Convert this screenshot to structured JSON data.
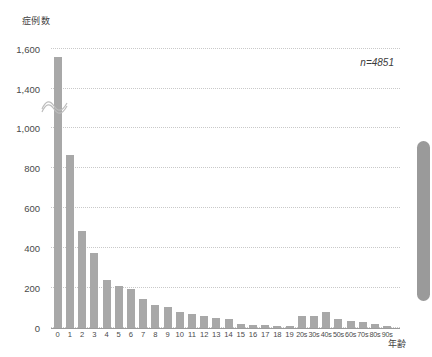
{
  "chart_data": {
    "type": "bar",
    "title": "",
    "ylabel": "症例数",
    "xlabel": "年齢",
    "annotation": "n=4851",
    "grid": true,
    "legend": false,
    "bar_color": "#a8a8a8",
    "axis_break": {
      "present": true,
      "between": [
        1000,
        1400
      ]
    },
    "ylim": [
      0,
      1600
    ],
    "yticks": [
      0,
      200,
      400,
      600,
      800,
      1000,
      1400,
      1600
    ],
    "ytick_labels": [
      "0",
      "200",
      "400",
      "600",
      "800",
      "1,000",
      "1,400",
      "1,600"
    ],
    "categories": [
      "0",
      "1",
      "2",
      "3",
      "4",
      "5",
      "6",
      "7",
      "8",
      "9",
      "10",
      "11",
      "12",
      "13",
      "14",
      "15",
      "16",
      "17",
      "18",
      "19",
      "20s",
      "30s",
      "40s",
      "50s",
      "60s",
      "70s",
      "80s",
      "90s"
    ],
    "values": [
      1560,
      865,
      487,
      375,
      240,
      212,
      196,
      143,
      117,
      103,
      78,
      72,
      62,
      50,
      44,
      22,
      16,
      14,
      10,
      8,
      58,
      62,
      78,
      46,
      36,
      30,
      18,
      10
    ]
  },
  "scrollbar": {
    "orientation": "vertical",
    "thumb_top_px": 141,
    "thumb_height_px": 160
  }
}
